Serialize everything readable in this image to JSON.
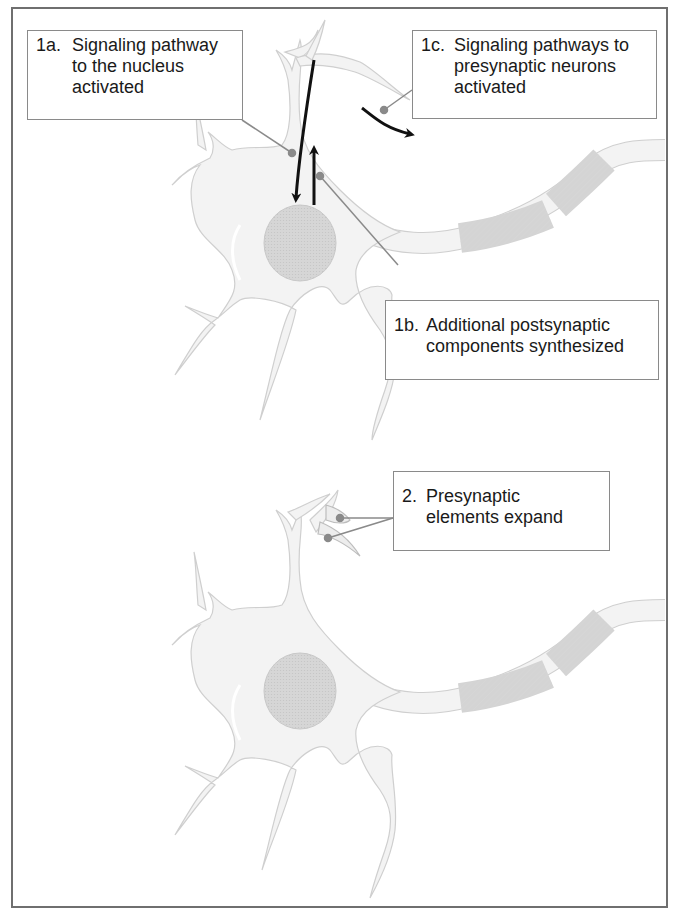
{
  "diagram": {
    "labels": {
      "l1a": {
        "number": "1a.",
        "lines": [
          "Signaling pathway",
          "to the nucleus",
          "activated"
        ]
      },
      "l1b": {
        "number": "1b.",
        "lines": [
          "Additional postsynaptic",
          "components synthesized"
        ]
      },
      "l1c": {
        "number": "1c.",
        "lines": [
          "Signaling pathways to",
          "presynaptic neurons",
          "activated"
        ]
      },
      "l2": {
        "number": "2.",
        "lines": [
          "Presynaptic",
          "elements expand"
        ]
      }
    },
    "colors": {
      "frame": "#6f6f6f",
      "cell_fill": "#f3f3f3",
      "cell_outline": "#c8c8c8",
      "nucleus_fill": "#d4d4d4",
      "leader_line": "#8a8a8a",
      "leader_dot": "#8a8a8a",
      "arrow": "#111111"
    }
  }
}
